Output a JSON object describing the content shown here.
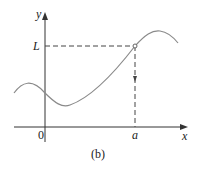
{
  "figure": {
    "caption": "(b)",
    "axes": {
      "x_label": "x",
      "y_label": "y",
      "origin_label": "0"
    },
    "marks": {
      "x_mark": "a",
      "y_mark": "L"
    },
    "colors": {
      "curve": "#8a8a8a",
      "axes": "#333333",
      "dashed": "#444444"
    }
  }
}
